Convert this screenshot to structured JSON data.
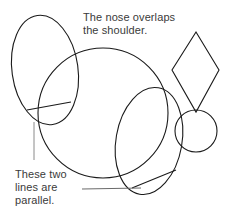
{
  "figure": {
    "background_color": "#ffffff",
    "stroke_color": "#1a1a1a",
    "text_color": "#3a3a3a",
    "width": 229,
    "height": 218
  },
  "annotations": {
    "nose_overlap": {
      "text": "The nose overlaps\nthe shoulder.",
      "line1": "The nose overlaps",
      "line2": "the shoulder."
    },
    "parallel_lines": {
      "text": "These two\nlines are\nparallel.",
      "line1": "These two",
      "line2": "lines are",
      "line3": "parallel."
    }
  },
  "shapes": [
    {
      "name": "head-ellipse",
      "type": "ellipse",
      "cx": 45,
      "cy": 70,
      "rx": 33,
      "ry": 55,
      "rotation": -8
    },
    {
      "name": "shoulder-circle",
      "type": "circle",
      "cx": 103,
      "cy": 113,
      "r": 65
    },
    {
      "name": "hindquarter-ellipse",
      "type": "ellipse",
      "cx": 149,
      "cy": 141,
      "rx": 33,
      "ry": 54,
      "rotation": 10
    },
    {
      "name": "muzzle-circle",
      "type": "circle",
      "cx": 196,
      "cy": 131,
      "r": 21
    },
    {
      "name": "ear-diamond",
      "type": "diamond",
      "top": [
        196,
        32
      ],
      "left": [
        172,
        70
      ],
      "right": [
        219,
        70
      ],
      "bottom": [
        196,
        112
      ]
    },
    {
      "name": "parallel-line-head",
      "type": "line",
      "x1": 27,
      "y1": 110,
      "x2": 71,
      "y2": 102
    },
    {
      "name": "parallel-line-hindquarter",
      "type": "line",
      "x1": 132,
      "y1": 188,
      "x2": 176,
      "y2": 170
    },
    {
      "name": "leader-line-parallel-upper",
      "type": "line",
      "x1": 34,
      "y1": 122,
      "x2": 34,
      "y2": 160
    },
    {
      "name": "leader-line-parallel-lower",
      "type": "line",
      "x1": 82,
      "y1": 189,
      "x2": 141,
      "y2": 188
    }
  ]
}
